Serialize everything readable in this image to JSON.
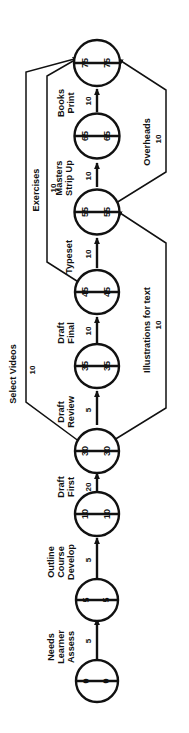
{
  "diagram": {
    "type": "pert-network",
    "orientation": "rotated-90-ccw",
    "colors": {
      "line": "#111111",
      "node_fill": "#ffffff",
      "text": "#111111"
    },
    "nodes": [
      {
        "id": "n0",
        "earliest": "0",
        "latest": "0"
      },
      {
        "id": "n5",
        "earliest": "5",
        "latest": "5"
      },
      {
        "id": "n10",
        "earliest": "10",
        "latest": "10"
      },
      {
        "id": "n30",
        "earliest": "30",
        "latest": "30"
      },
      {
        "id": "n35",
        "earliest": "35",
        "latest": "35"
      },
      {
        "id": "n45",
        "earliest": "45",
        "latest": "45"
      },
      {
        "id": "n55",
        "earliest": "55",
        "latest": "55"
      },
      {
        "id": "n65",
        "earliest": "65",
        "latest": "65"
      },
      {
        "id": "n75",
        "earliest": "75",
        "latest": "75"
      }
    ],
    "activities": [
      {
        "id": "a1",
        "name": "Assess Learner Needs",
        "lines": [
          "Assess",
          "Learner",
          "Needs"
        ],
        "duration": "5",
        "from": "n0",
        "to": "n5"
      },
      {
        "id": "a2",
        "name": "Develop Course Outline",
        "lines": [
          "Develop",
          "Course",
          "Outline"
        ],
        "duration": "5",
        "from": "n5",
        "to": "n10"
      },
      {
        "id": "a3",
        "name": "First Draft",
        "lines": [
          "First",
          "Draft"
        ],
        "duration": "20",
        "from": "n10",
        "to": "n30"
      },
      {
        "id": "a4",
        "name": "Review Draft",
        "lines": [
          "Review",
          "Draft"
        ],
        "duration": "5",
        "from": "n30",
        "to": "n35"
      },
      {
        "id": "a5",
        "name": "Final Draft",
        "lines": [
          "Final",
          "Draft"
        ],
        "duration": "10",
        "from": "n35",
        "to": "n45"
      },
      {
        "id": "a6",
        "name": "Typeset",
        "lines": [
          "Typeset"
        ],
        "duration": "10",
        "from": "n45",
        "to": "n55"
      },
      {
        "id": "a7",
        "name": "Strip Up Masters",
        "lines": [
          "Strip Up",
          "Masters"
        ],
        "duration": "10",
        "from": "n55",
        "to": "n65"
      },
      {
        "id": "a8",
        "name": "Print Books",
        "lines": [
          "Print",
          "Books"
        ],
        "duration": "10",
        "from": "n65",
        "to": "n75"
      },
      {
        "id": "a9",
        "name": "Select Videos",
        "lines": [
          "Select Videos"
        ],
        "duration": "10",
        "from": "n30",
        "to": "n75"
      },
      {
        "id": "a10",
        "name": "Exercises",
        "lines": [
          "Exercises"
        ],
        "duration": "10",
        "from": "n45",
        "to": "n75"
      },
      {
        "id": "a11",
        "name": "Illustrations for text",
        "lines": [
          "Illustrations for text"
        ],
        "duration": "10",
        "from": "n30",
        "to": "n55"
      },
      {
        "id": "a12",
        "name": "Overheads",
        "lines": [
          "Overheads"
        ],
        "duration": "10",
        "from": "n55",
        "to": "n75"
      }
    ]
  }
}
